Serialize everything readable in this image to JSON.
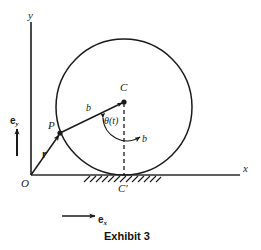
{
  "figure": {
    "caption": "Exhibit 3",
    "axes": {
      "y_label": "y",
      "x_label": "x",
      "origin_label": "O"
    },
    "points": {
      "center_label": "C",
      "contact_label": "C'",
      "particle_label": "P"
    },
    "segments": {
      "radius_to_p_label": "b",
      "radius_to_bottom_label": "b"
    },
    "angle_label": "θ(t)",
    "vectors": {
      "position_vector_label": "r",
      "unit_vector_y_label": "e",
      "unit_vector_y_sub": "y",
      "unit_vector_x_label": "e",
      "unit_vector_x_sub": "x"
    },
    "colors": {
      "ink": "#1a1a1a",
      "line": "#2b2b2b",
      "background": "#ffffff"
    },
    "geometry": {
      "circle_center_x": 124,
      "circle_center_y": 107,
      "circle_radius": 68,
      "ground_y": 175,
      "y_axis_x": 31,
      "x_axis_end": 240
    }
  }
}
